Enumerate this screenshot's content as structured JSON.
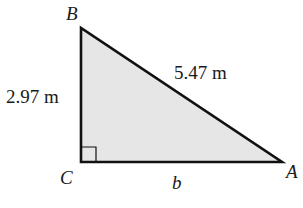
{
  "diagram": {
    "type": "right-triangle",
    "vertices": [
      {
        "name": "B",
        "x": 81,
        "y": 28
      },
      {
        "name": "C",
        "x": 81,
        "y": 162
      },
      {
        "name": "A",
        "x": 282,
        "y": 162
      }
    ],
    "right_angle_at": "C",
    "labels": {
      "vertex_b": "B",
      "vertex_c": "C",
      "vertex_a": "A",
      "side_bc": "2.97 m",
      "side_ab": "5.47 m",
      "side_ca": "b"
    },
    "colors": {
      "fill": "#e6e6e6",
      "stroke": "#111111",
      "text": "#1a1a1a"
    }
  }
}
